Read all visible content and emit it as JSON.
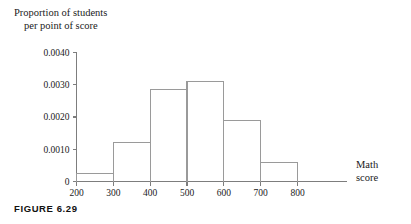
{
  "figure": {
    "caption": "FIGURE 6.29"
  },
  "chart_data": {
    "type": "bar",
    "title": "",
    "subtitle": "",
    "ylabel_line1": "Proportion of students",
    "ylabel_line2": "per point of score",
    "xlabel_line1": "Math",
    "xlabel_line2": "score",
    "xlabel": "Math score",
    "ylabel": "Proportion of students per point of score",
    "histogram": true,
    "bin_edges": [
      200,
      300,
      400,
      500,
      600,
      700,
      800
    ],
    "categories": [
      "200-300",
      "300-400",
      "400-500",
      "500-600",
      "600-700",
      "700-800"
    ],
    "values": [
      0.00025,
      0.0012,
      0.00285,
      0.0031,
      0.0019,
      0.0006
    ],
    "xlim": [
      200,
      800
    ],
    "ylim": [
      0,
      0.004
    ],
    "x_ticks": [
      200,
      300,
      400,
      500,
      600,
      700,
      800
    ],
    "x_tick_labels": [
      "200",
      "300",
      "400",
      "500",
      "600",
      "700",
      "800"
    ],
    "y_ticks": [
      0,
      0.001,
      0.002,
      0.003,
      0.004
    ],
    "y_tick_labels": [
      "0",
      "0.0010",
      "0.0020",
      "0.0030",
      "0.0040"
    ],
    "grid": false,
    "legend": null,
    "bar_fill": "#ffffff",
    "bar_stroke": "#9a9a9a",
    "axis_color": "#7d7d7d"
  }
}
